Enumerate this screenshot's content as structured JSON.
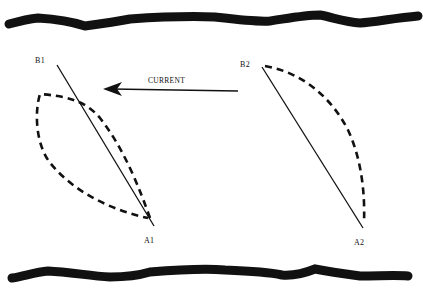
{
  "diagram": {
    "labels": {
      "b1": "B1",
      "b2": "B2",
      "a1": "A1",
      "a2": "A2",
      "current": "CURRENT"
    },
    "colors": {
      "ink": "#111111",
      "background": "#ffffff"
    },
    "elements": [
      {
        "id": "top-bank",
        "type": "thick-wavy-line"
      },
      {
        "id": "bottom-bank",
        "type": "thick-wavy-line"
      },
      {
        "id": "line-b1-a1",
        "type": "solid-line",
        "from": "B1",
        "to": "A1"
      },
      {
        "id": "loop-1",
        "type": "dashed-curve",
        "side": "left"
      },
      {
        "id": "line-b2-a2",
        "type": "solid-line",
        "from": "B2",
        "to": "A2"
      },
      {
        "id": "loop-2",
        "type": "dashed-curve",
        "side": "right"
      },
      {
        "id": "current-arrow",
        "type": "arrow",
        "direction": "left",
        "label": "CURRENT"
      }
    ]
  }
}
